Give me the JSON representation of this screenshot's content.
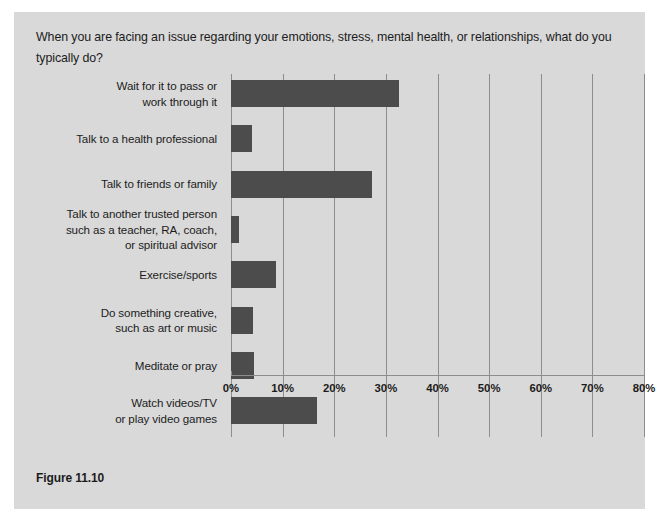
{
  "figure": {
    "question": "When you are facing an issue regarding your emotions, stress, mental health, or relationships, what do you typically do?",
    "caption": "Figure 11.10",
    "panel_bg": "#d9d9d9",
    "bar_color": "#4c4c4c",
    "grid_color": "#8d8d8d"
  },
  "chart_data": {
    "type": "bar",
    "orientation": "horizontal",
    "title": "When you are facing an issue regarding your emotions, stress, mental health, or relationships, what do you typically do?",
    "xlabel": "",
    "ylabel": "",
    "xlim": [
      0,
      80
    ],
    "xticks": [
      0,
      10,
      20,
      30,
      40,
      50,
      60,
      70,
      80
    ],
    "xtick_labels": [
      "0%",
      "10%",
      "20%",
      "30%",
      "40%",
      "50%",
      "60%",
      "70%",
      "80%"
    ],
    "grid": true,
    "legend": false,
    "categories": [
      "Wait for it to pass or work through it",
      "Talk to a health professional",
      "Talk to friends or family",
      "Talk to another trusted person such as a teacher, RA, coach, or spiritual advisor",
      "Exercise/sports",
      "Do something creative, such as art or music",
      "Meditate or pray",
      "Watch videos/TV or play video games"
    ],
    "category_lines": [
      [
        "Wait for it to pass or",
        "work through it"
      ],
      [
        "Talk to a health professional"
      ],
      [
        "Talk to friends or family"
      ],
      [
        "Talk to another trusted person",
        "such as a teacher, RA, coach,",
        "or spiritual advisor"
      ],
      [
        "Exercise/sports"
      ],
      [
        "Do something creative,",
        "such as art or music"
      ],
      [
        "Meditate or pray"
      ],
      [
        "Watch videos/TV",
        "or play video games"
      ]
    ],
    "values": [
      32.5,
      4.0,
      27.3,
      1.5,
      8.7,
      4.3,
      4.4,
      16.7
    ],
    "units": "percent"
  }
}
